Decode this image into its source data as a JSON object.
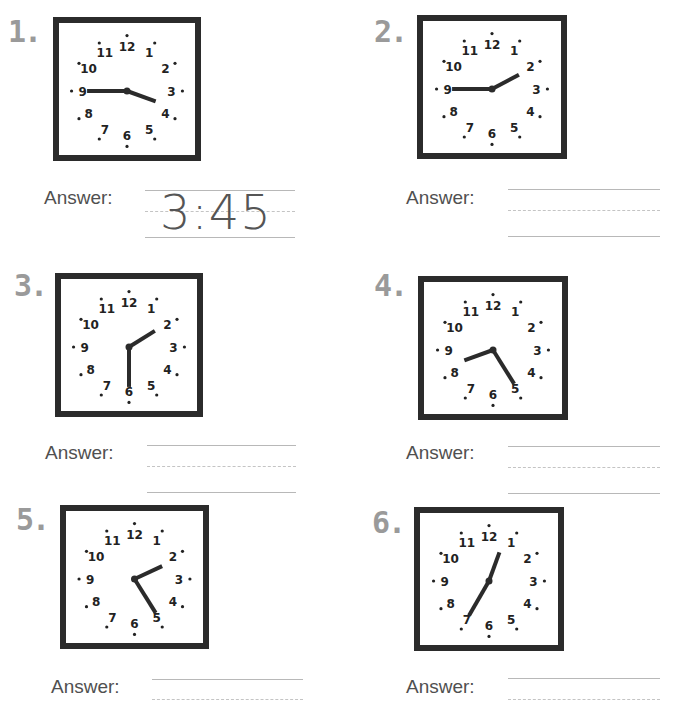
{
  "worksheet": {
    "answer_label": "Answer:",
    "clock_numbers": [
      "12",
      "1",
      "2",
      "3",
      "4",
      "5",
      "6",
      "7",
      "8",
      "9",
      "10",
      "11"
    ],
    "colors": {
      "frame": "#2b2b2b",
      "hands": "#2b2b2b",
      "number_label": "#9a9a9a",
      "answer_text": "#505050",
      "guide_line": "#b8b8b8"
    },
    "questions": [
      {
        "number": "1.",
        "hour_hand_deg": 110,
        "minute_hand_deg": 270,
        "answer": "3:45"
      },
      {
        "number": "2.",
        "hour_hand_deg": 62,
        "minute_hand_deg": 270,
        "answer": ""
      },
      {
        "number": "3.",
        "hour_hand_deg": 58,
        "minute_hand_deg": 180,
        "answer": ""
      },
      {
        "number": "4.",
        "hour_hand_deg": 250,
        "minute_hand_deg": 148,
        "answer": ""
      },
      {
        "number": "5.",
        "hour_hand_deg": 65,
        "minute_hand_deg": 148,
        "answer": ""
      },
      {
        "number": "6.",
        "hour_hand_deg": 20,
        "minute_hand_deg": 210,
        "answer": ""
      }
    ]
  }
}
